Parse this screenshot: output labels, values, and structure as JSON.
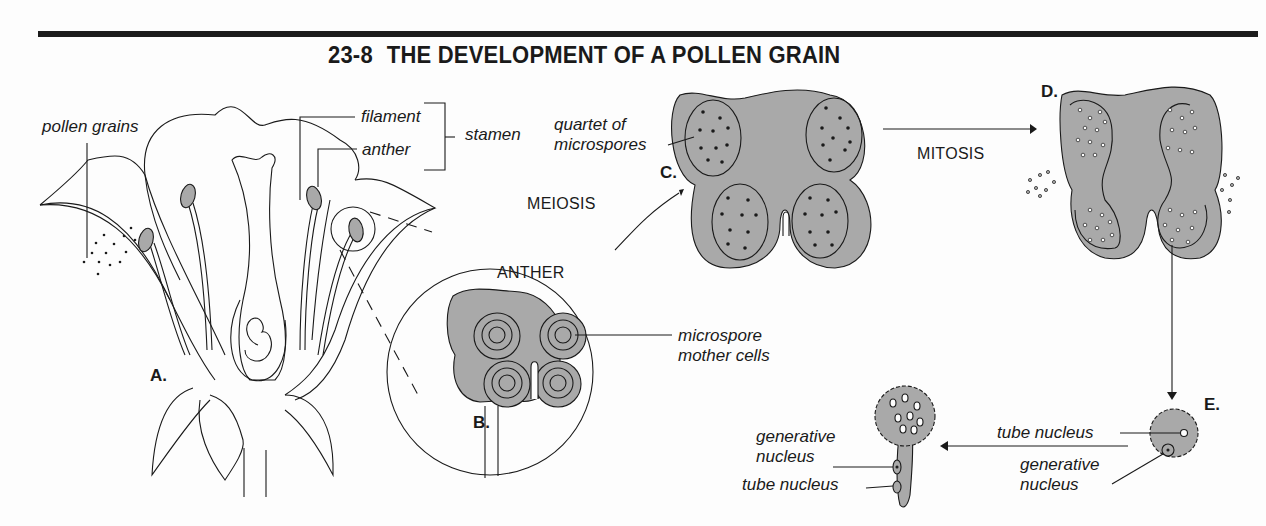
{
  "title": {
    "number": "23-8",
    "text": "THE DEVELOPMENT OF A POLLEN GRAIN"
  },
  "panels": {
    "A": {
      "letter": "A.",
      "subject": "flower cross-section"
    },
    "B": {
      "letter": "B.",
      "heading": "ANTHER"
    },
    "C": {
      "letter": "C."
    },
    "D": {
      "letter": "D."
    },
    "E": {
      "letter": "E."
    }
  },
  "labels": {
    "pollen_grains": "pollen grains",
    "filament": "filament",
    "anther": "anther",
    "stamen": "stamen",
    "quartet_line1": "quartet of",
    "quartet_line2": "microspores",
    "microspore_line1": "microspore",
    "microspore_line2": "mother cells",
    "e_tube_nucleus": "tube nucleus",
    "e_generative_line1": "generative",
    "e_generative_line2": "nucleus",
    "f_generative_line1": "generative",
    "f_generative_line2": "nucleus",
    "f_tube_nucleus": "tube nucleus"
  },
  "processes": {
    "meiosis": "MEIOSIS",
    "mitosis": "MITOSIS"
  },
  "colors": {
    "tissue_fill": "#a9a9a9",
    "line": "#1a1a1a",
    "background": "#fdfdfd"
  }
}
